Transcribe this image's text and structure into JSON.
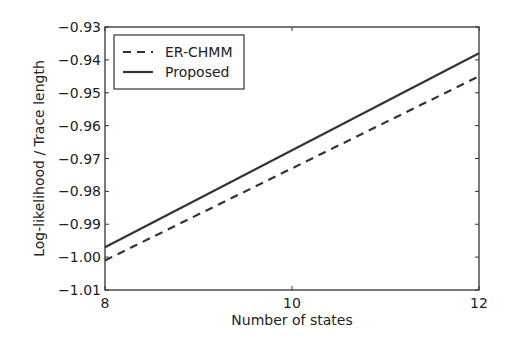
{
  "chart_data": {
    "type": "line",
    "title": "",
    "xlabel": "Number of states",
    "ylabel": "Log-likelihood / Trace length",
    "xlim": [
      8,
      12
    ],
    "ylim": [
      -1.01,
      -0.93
    ],
    "x_ticks": [
      "8",
      "10",
      "12"
    ],
    "y_ticks": [
      "-0.93",
      "-0.94",
      "-0.95",
      "-0.96",
      "-0.97",
      "-0.98",
      "-0.99",
      "-1.00",
      "-1.01"
    ],
    "x": [
      8,
      12
    ],
    "series": [
      {
        "name": "ER-CHMM",
        "style": "dashed",
        "values": [
          -1.001,
          -0.945
        ]
      },
      {
        "name": "Proposed",
        "style": "solid",
        "values": [
          -0.997,
          -0.938
        ]
      }
    ],
    "legend": {
      "position": "upper left",
      "entries": [
        "ER-CHMM",
        "Proposed"
      ]
    },
    "grid": false
  }
}
